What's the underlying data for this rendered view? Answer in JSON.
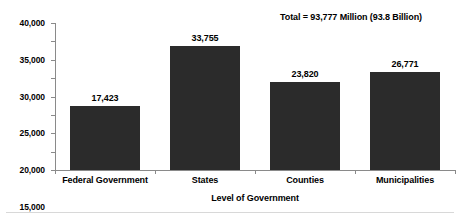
{
  "chart_data": {
    "type": "bar",
    "title": "",
    "subtitle": "",
    "xlabel": "Level of Government",
    "ylabel": "",
    "categories": [
      "Federal Government",
      "States",
      "Counties",
      "Municipalities"
    ],
    "values": [
      17423,
      33755,
      23820,
      26771
    ],
    "value_labels": [
      "17,423",
      "33,755",
      "23,820",
      "26,771"
    ],
    "ylim": [
      0,
      40000
    ],
    "ytick_step": 5000,
    "ytick_labels": [
      "0",
      "5,000",
      "10,000",
      "15,000",
      "20,000",
      "25,000",
      "30,000",
      "35,000",
      "40,000"
    ],
    "ytick_values": [
      0,
      5000,
      10000,
      15000,
      20000,
      25000,
      30000,
      35000,
      40000
    ],
    "grid": false,
    "legend": false,
    "annotation": "Total = 93,777 Million (93.8 Billion)",
    "bar_color": "#2b2b2b",
    "axis_color": "#8a8a8a",
    "background_color": "#ffffff",
    "text_color": "#000000"
  }
}
